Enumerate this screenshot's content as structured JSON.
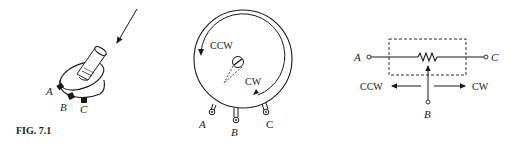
{
  "figure": {
    "caption": "FIG. 7.1",
    "colors": {
      "ink": "#1a1a1a",
      "background": "#ffffff"
    }
  },
  "panel_physical": {
    "terminals": [
      {
        "label": "A"
      },
      {
        "label": "B"
      },
      {
        "label": "C"
      }
    ]
  },
  "panel_front_view": {
    "rotation_labels": {
      "ccw": "CCW",
      "cw": "CW"
    },
    "terminals": [
      {
        "label": "A"
      },
      {
        "label": "B"
      },
      {
        "label": "C"
      }
    ]
  },
  "panel_schematic": {
    "terminals": {
      "a": "A",
      "b": "B",
      "c": "C"
    },
    "direction_labels": {
      "ccw": "CCW",
      "cw": "CW"
    }
  }
}
